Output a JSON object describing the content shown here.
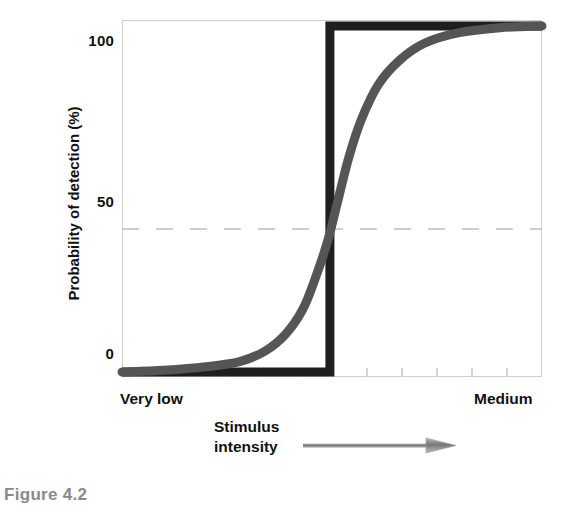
{
  "figure": {
    "caption": "Figure 4.2",
    "caption_color": "#8a8a8a"
  },
  "chart_data": {
    "type": "line",
    "title": "",
    "xlabel": "Stimulus intensity",
    "ylabel": "Probability of detection (%)",
    "x_axis": {
      "label_left": "Very low",
      "label_right": "Medium",
      "caption_line1": "Stimulus",
      "caption_line2": "intensity",
      "arrow_direction": "right",
      "arrow_color": "#8c8c8c",
      "tick_count": 11,
      "ticks_labeled": false
    },
    "y_axis": {
      "label": "Probability of detection (%)",
      "ticks": [
        "0",
        "50",
        "100"
      ],
      "tick_values": [
        0,
        50,
        100
      ],
      "ylim": [
        0,
        100
      ],
      "unit": "%"
    },
    "gridlines": {
      "horizontal_dashed_at": 50,
      "color": "#bfbfbf",
      "style": "dashed"
    },
    "series": [
      {
        "name": "Theoretical absolute threshold (step function)",
        "style": "step",
        "color": "#1f1f1f",
        "width": 9,
        "points": [
          {
            "x": 0,
            "y": 0
          },
          {
            "x": 49.5,
            "y": 0
          },
          {
            "x": 49.5,
            "y": 100
          },
          {
            "x": 100,
            "y": 100
          }
        ]
      },
      {
        "name": "Observed detection curve (sigmoid)",
        "style": "smooth",
        "color": "#555555",
        "width": 9,
        "points": [
          {
            "x": 0,
            "y": 0
          },
          {
            "x": 10,
            "y": 0.5
          },
          {
            "x": 20,
            "y": 1.5
          },
          {
            "x": 28,
            "y": 3
          },
          {
            "x": 34,
            "y": 6
          },
          {
            "x": 39,
            "y": 11
          },
          {
            "x": 43,
            "y": 18
          },
          {
            "x": 46,
            "y": 27
          },
          {
            "x": 49,
            "y": 38
          },
          {
            "x": 51.5,
            "y": 50
          },
          {
            "x": 54,
            "y": 62
          },
          {
            "x": 57,
            "y": 73
          },
          {
            "x": 61,
            "y": 83
          },
          {
            "x": 66,
            "y": 90
          },
          {
            "x": 72,
            "y": 95
          },
          {
            "x": 80,
            "y": 98
          },
          {
            "x": 90,
            "y": 99.5
          },
          {
            "x": 100,
            "y": 100
          }
        ]
      }
    ],
    "annotations": [
      {
        "text": "50",
        "type": "y-tick"
      },
      {
        "text": "0",
        "type": "y-tick"
      },
      {
        "text": "100",
        "type": "y-tick"
      }
    ]
  }
}
